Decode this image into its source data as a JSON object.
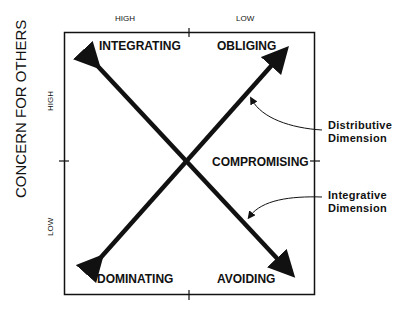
{
  "axes": {
    "top_high": "HIGH",
    "top_low": "LOW",
    "left_title": "CONCERN FOR OTHERS",
    "left_high": "HIGH",
    "left_low": "LOW"
  },
  "styles": {
    "top_left": "INTEGRATING",
    "top_right": "OBLIGING",
    "center": "COMPROMISING",
    "bottom_left": "DOMINATING",
    "bottom_right": "AVOIDING"
  },
  "annotations": {
    "distributive_line1": "Distributive",
    "distributive_line2": "Dimension",
    "integrative_line1": "Integrative",
    "integrative_line2": "Dimension"
  },
  "colors": {
    "line": "#111111",
    "background": "#ffffff"
  }
}
